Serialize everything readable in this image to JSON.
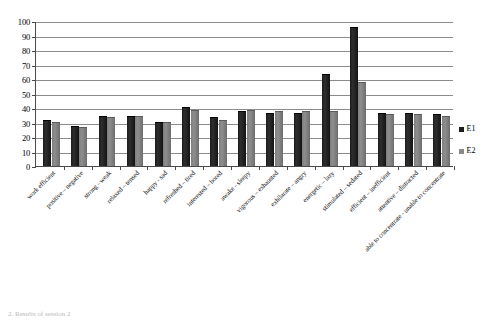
{
  "chart_data": {
    "type": "bar",
    "title": "",
    "subtitle": "",
    "xlabel": "",
    "ylabel": "",
    "ylim": [
      0,
      100
    ],
    "y_ticks": [
      0,
      10,
      20,
      30,
      40,
      50,
      60,
      70,
      80,
      90,
      100
    ],
    "grid": true,
    "legend_position": "right",
    "categories": [
      "work efficient",
      "positive – negative",
      "strong - weak",
      "relaxed – tensed",
      "happy - sad",
      "refreshed – tired",
      "interested – bored",
      "awake - sleepy",
      "vigorous – exhausted",
      "exhilarate – angry",
      "energetic – lazy",
      "stimulated – sedated",
      "efficient – inefficient",
      "attentive – distracted",
      "able to concentrate - unable to concentrate"
    ],
    "series": [
      {
        "name": "E1",
        "color": "#1c1c1c",
        "values": [
          31,
          27,
          34,
          34,
          30,
          40,
          33,
          37,
          36,
          36,
          63,
          95,
          36,
          36,
          35
        ]
      },
      {
        "name": "E2",
        "color": "#8a8a8a",
        "values": [
          30,
          26,
          33,
          34,
          30,
          38,
          31,
          38,
          37,
          37,
          37,
          57,
          35,
          35,
          34
        ]
      }
    ]
  },
  "legend": {
    "items": [
      {
        "label": "E1"
      },
      {
        "label": "E2"
      }
    ]
  },
  "caption": {
    "text": "2.  Results of session 2"
  }
}
